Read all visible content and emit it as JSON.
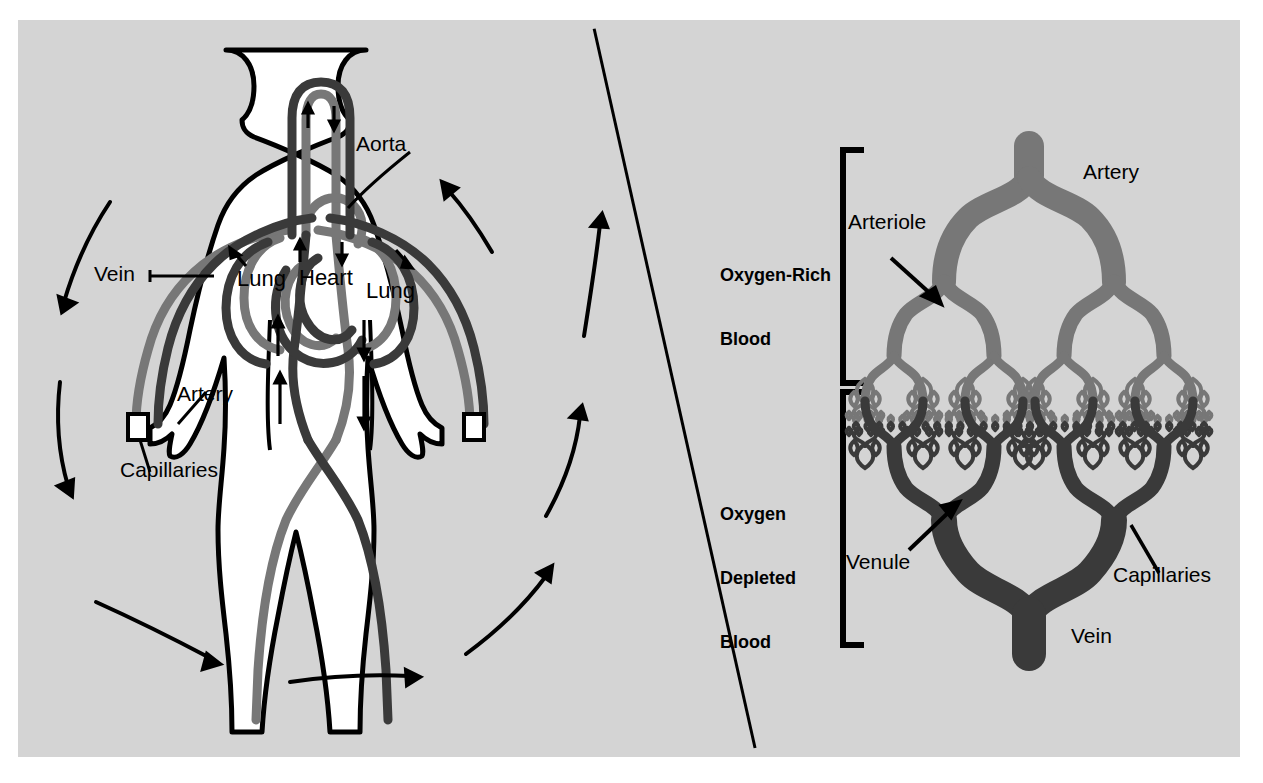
{
  "figure": {
    "background_color": "#d4d4d4",
    "page_color": "#ffffff",
    "oxygen_rich_color": "#777777",
    "oxygen_depleted_color": "#3a3a3a",
    "outline_color": "#000000"
  },
  "left_panel": {
    "name": "body-circulation-diagram",
    "labels": {
      "aorta": "Aorta",
      "vein": "Vein",
      "artery": "Artery",
      "capillaries": "Capillaries",
      "heart": "Heart",
      "lung_left": "Lung",
      "lung_right": "Lung"
    },
    "flow_arrows": {
      "count": 8,
      "direction_description": "clockwise loop around the body figure"
    }
  },
  "right_panel": {
    "name": "capillary-bed-diagram",
    "brackets": {
      "upper_label": "Oxygen-Rich\nBlood",
      "upper_label_line1": "Oxygen-Rich",
      "upper_label_line2": "Blood",
      "lower_label_line1": "Oxygen",
      "lower_label_line2": "Depleted",
      "lower_label_line3": "Blood"
    },
    "labels": {
      "artery": "Artery",
      "arteriole": "Arteriole",
      "capillaries": "Capillaries",
      "venule": "Venule",
      "vein": "Vein"
    }
  },
  "chart_data": {
    "type": "diagram",
    "panels": [
      {
        "name": "Body circulation",
        "elements": [
          "Aorta",
          "Vein",
          "Artery",
          "Capillaries",
          "Heart",
          "Lung",
          "Lung"
        ],
        "notes": "Human figure showing oxygen-rich (gray) and oxygen-depleted (dark) vessels; curved arrows indicate direction of circulation."
      },
      {
        "name": "Capillary bed",
        "elements": [
          "Artery",
          "Arteriole",
          "Capillaries",
          "Venule",
          "Vein"
        ],
        "brackets": [
          "Oxygen-Rich Blood",
          "Oxygen Depleted Blood"
        ],
        "notes": "Branching vessel tree: artery divides into arterioles then capillaries, which converge into venules and a vein."
      }
    ]
  }
}
